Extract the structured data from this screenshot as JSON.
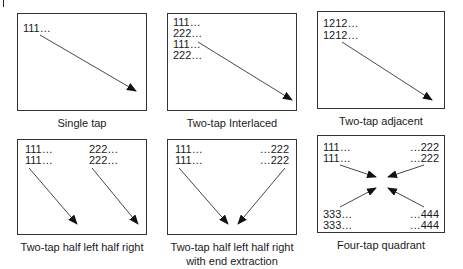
{
  "figure": {
    "corner_mark": "|",
    "panels": [
      {
        "id": "single-tap",
        "caption": "Single tap",
        "labels": [
          "111…"
        ],
        "arrows": 1
      },
      {
        "id": "two-tap-interlaced",
        "caption": "Two-tap Interlaced",
        "labels": [
          "111…",
          "222…",
          "111…",
          "222…"
        ],
        "arrows": 1
      },
      {
        "id": "two-tap-adjacent",
        "caption": "Two-tap adjacent",
        "labels": [
          "1212…",
          "1212…"
        ],
        "arrows": 1
      },
      {
        "id": "two-tap-half-left-half-right",
        "caption": "Two-tap half left half right",
        "labels_left": [
          "111…",
          "111…"
        ],
        "labels_right": [
          "222…",
          "222…"
        ],
        "arrows": 2
      },
      {
        "id": "two-tap-half-left-half-right-end-extraction",
        "caption_line1": "Two-tap half left half right",
        "caption_line2": "with end extraction",
        "labels_left": [
          "111…",
          "111…"
        ],
        "labels_right": [
          "…222",
          "…222"
        ],
        "arrows": 2
      },
      {
        "id": "four-tap-quadrant",
        "caption": "Four-tap quadrant",
        "labels_top_left": [
          "111…",
          "111…"
        ],
        "labels_top_right": [
          "…222",
          "…222"
        ],
        "labels_bottom_left": [
          "333…",
          "333…"
        ],
        "labels_bottom_right": [
          "…444",
          "…444"
        ],
        "arrows": 4
      }
    ],
    "colors": {
      "line": "#333333",
      "text": "#1a1a1a",
      "background": "#ffffff"
    }
  }
}
